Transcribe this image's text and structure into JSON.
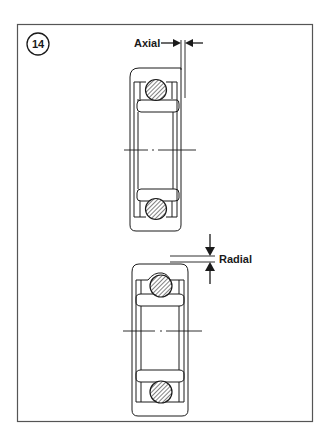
{
  "figure": {
    "number": "14",
    "labels": {
      "axial": "Axial",
      "radial": "Radial"
    },
    "parts": [
      {
        "name": "top-bearing",
        "clearance_type": "Axial"
      },
      {
        "name": "bottom-bearing",
        "clearance_type": "Radial"
      }
    ],
    "colors": {
      "line": "#1a1a1a",
      "frame": "#555555",
      "background": "#ffffff"
    }
  }
}
